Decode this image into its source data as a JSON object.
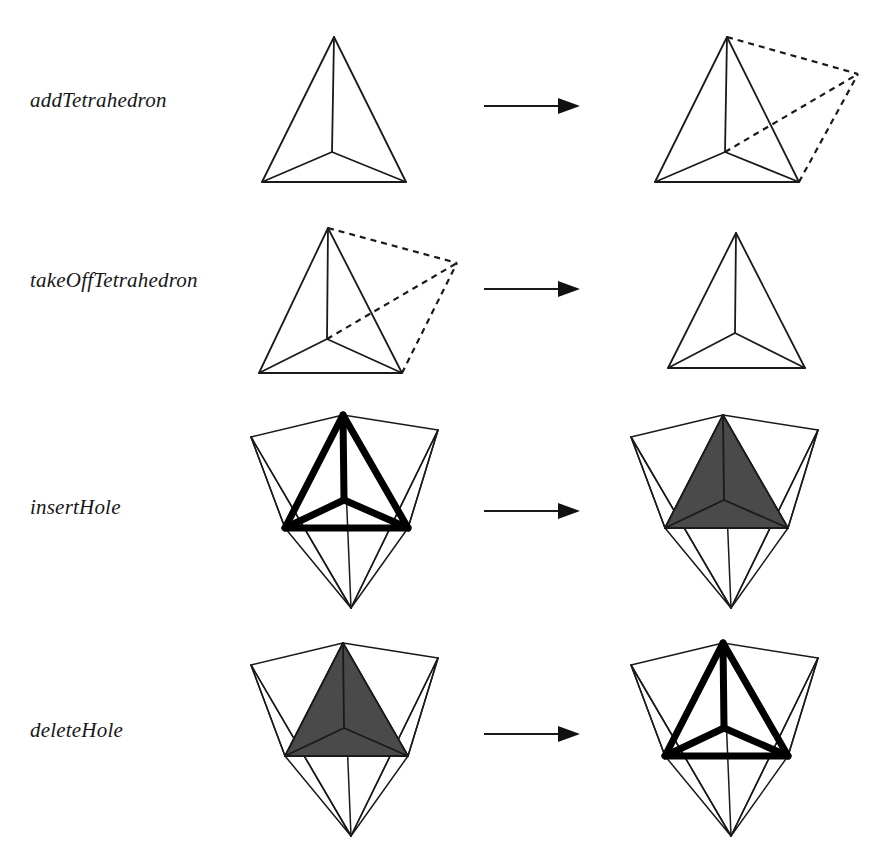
{
  "figure": {
    "background_color": "#ffffff",
    "line_color": "#1a1a1a",
    "hole_fill_color": "#4a4a4a",
    "width": 887,
    "height": 867
  },
  "rows": [
    {
      "id": "add-tetrahedron",
      "label": "addTetrahedron",
      "label_top": 88,
      "row_top": 0,
      "before": {
        "kind": "tetrahedron",
        "x": 250,
        "y": 20
      },
      "after": {
        "kind": "tetrahedron-with-dashed-tetrahedron",
        "x": 650,
        "y": 20
      },
      "arrow": {
        "x": 484,
        "y": 95,
        "length": 96
      }
    },
    {
      "id": "take-off-tetrahedron",
      "label": "takeOffTetrahedron",
      "label_top": 268,
      "row_top": 205,
      "before": {
        "kind": "tetrahedron-with-dashed-tetrahedron",
        "x": 232,
        "y": 215
      },
      "after": {
        "kind": "tetrahedron",
        "x": 650,
        "y": 228
      },
      "arrow": {
        "x": 484,
        "y": 278,
        "length": 96
      }
    },
    {
      "id": "insert-hole",
      "label": "insertHole",
      "label_top": 495,
      "row_top": 400,
      "before": {
        "kind": "nested-hole-outline",
        "x": 248,
        "y": 405
      },
      "after": {
        "kind": "nested-hole-filled",
        "x": 628,
        "y": 405
      },
      "arrow": {
        "x": 484,
        "y": 500,
        "length": 96
      }
    },
    {
      "id": "delete-hole",
      "label": "deleteHole",
      "label_top": 718,
      "row_top": 630,
      "before": {
        "kind": "nested-hole-filled",
        "x": 248,
        "y": 633
      },
      "after": {
        "kind": "nested-hole-outline",
        "x": 628,
        "y": 633
      },
      "arrow": {
        "x": 484,
        "y": 723,
        "length": 96
      }
    }
  ],
  "arrow_symbol": "right-arrow",
  "caption": {
    "visible_fragment": ""
  }
}
